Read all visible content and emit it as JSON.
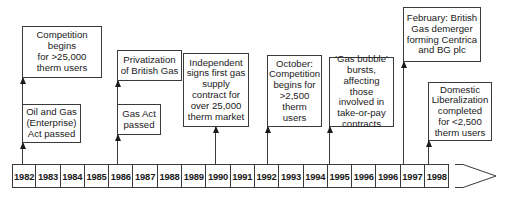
{
  "timeline": {
    "years": [
      "1982",
      "1983",
      "1984",
      "1985",
      "1986",
      "1987",
      "1988",
      "1989",
      "1990",
      "1991",
      "1992",
      "1993",
      "1994",
      "1995",
      "1996",
      "1996",
      "1997",
      "1998"
    ],
    "line_color": "#3a3a3a"
  },
  "events": [
    {
      "year": "1982",
      "text": "Competition\nbegins\nfor >25,000\ntherm users"
    },
    {
      "year": "1982",
      "text": "Oil and Gas\n(Enterprise)\nAct passed"
    },
    {
      "year": "1986",
      "text": "Privatization\nof British Gas"
    },
    {
      "year": "1986",
      "text": "Gas Act\npassed"
    },
    {
      "year": "1990",
      "text": "Independent\nsigns first gas\nsupply\ncontract for\nover 25,000\ntherm market"
    },
    {
      "year": "1992",
      "text": "October:\nCompetition\nbegins for\n>2,500\ntherm\nusers"
    },
    {
      "year": "1995",
      "text": "'Gas bubble'\nbursts,\naffecting those\ninvolved in\ntake-or-pay\ncontracts"
    },
    {
      "year": "1997",
      "text": "February: British\nGas demerger\nforming Centrica\nand BG plc"
    },
    {
      "year": "1998",
      "text": "Domestic\nLiberalization\ncompleted\nfor <2,500\ntherm users"
    }
  ]
}
